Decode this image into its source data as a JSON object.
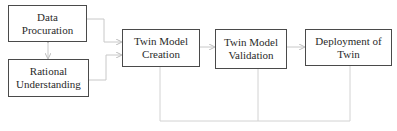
{
  "diagram": {
    "type": "flowchart",
    "nodes": [
      {
        "id": "data-procuration",
        "lines": [
          "Data",
          "Procuration"
        ]
      },
      {
        "id": "rational-understanding",
        "lines": [
          "Rational",
          "Understanding"
        ]
      },
      {
        "id": "twin-model-creation",
        "lines": [
          "Twin Model",
          "Creation"
        ]
      },
      {
        "id": "twin-model-validation",
        "lines": [
          "Twin Model",
          "Validation"
        ]
      },
      {
        "id": "deployment-of-twin",
        "lines": [
          "Deployment of",
          "Twin"
        ]
      }
    ],
    "edges": [
      {
        "from": "data-procuration",
        "to": "rational-understanding",
        "style": "bidirectional"
      },
      {
        "from": "data-procuration",
        "to": "twin-model-creation",
        "style": "arrow"
      },
      {
        "from": "rational-understanding",
        "to": "twin-model-creation",
        "style": "arrow"
      },
      {
        "from": "twin-model-creation",
        "to": "twin-model-validation",
        "style": "arrow"
      },
      {
        "from": "twin-model-validation",
        "to": "deployment-of-twin",
        "style": "arrow"
      },
      {
        "from": "twin-model-creation",
        "to": "deployment-of-twin",
        "style": "feedback-loop",
        "via": "twin-model-validation"
      }
    ],
    "colors": {
      "box_border": "#4a4a4a",
      "connector": "#c8c8c8",
      "text": "#2a2a2a"
    }
  }
}
